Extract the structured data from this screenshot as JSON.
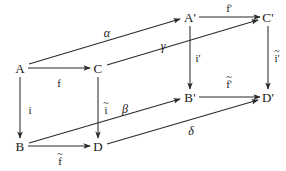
{
  "figure": {
    "kind": "commutative-cube-diagram",
    "background_color": "#ffffff",
    "stroke_color": "#2a2a2a",
    "text_color": "#181818"
  },
  "vertices": [
    {
      "id": "A",
      "label": "A",
      "x": 20,
      "y": 68
    },
    {
      "id": "C",
      "label": "C",
      "x": 98,
      "y": 68
    },
    {
      "id": "B",
      "label": "B",
      "x": 20,
      "y": 146
    },
    {
      "id": "D",
      "label": "D",
      "x": 98,
      "y": 146
    },
    {
      "id": "Ap",
      "label": "A'",
      "x": 190,
      "y": 17
    },
    {
      "id": "Cp",
      "label": "C'",
      "x": 268,
      "y": 17
    },
    {
      "id": "Bp",
      "label": "B'",
      "x": 190,
      "y": 97
    },
    {
      "id": "Dp",
      "label": "D'",
      "x": 268,
      "y": 97
    }
  ],
  "edges": [
    {
      "id": "A-to-C",
      "from": "A",
      "to": "C",
      "label": "f",
      "tilde": false,
      "greek": false,
      "label_x": 59,
      "label_y": 83
    },
    {
      "id": "A-to-B",
      "from": "A",
      "to": "B",
      "label": "i",
      "tilde": false,
      "greek": false,
      "label_x": 30,
      "label_y": 110
    },
    {
      "id": "C-to-D",
      "from": "C",
      "to": "D",
      "label": "i",
      "tilde": true,
      "greek": false,
      "label_x": 106,
      "label_y": 110
    },
    {
      "id": "B-to-D",
      "from": "B",
      "to": "D",
      "label": "f",
      "tilde": true,
      "greek": false,
      "label_x": 60,
      "label_y": 161
    },
    {
      "id": "Ap-to-Cp",
      "from": "Ap",
      "to": "Cp",
      "label": "f'",
      "tilde": false,
      "greek": false,
      "label_x": 229,
      "label_y": 8
    },
    {
      "id": "Ap-to-Bp",
      "from": "Ap",
      "to": "Bp",
      "label": "i'",
      "tilde": false,
      "greek": false,
      "label_x": 198,
      "label_y": 58
    },
    {
      "id": "Cp-to-Dp",
      "from": "Cp",
      "to": "Dp",
      "label": "i'",
      "tilde": true,
      "greek": false,
      "label_x": 277,
      "label_y": 58
    },
    {
      "id": "Bp-to-Dp",
      "from": "Bp",
      "to": "Dp",
      "label": "f'",
      "tilde": true,
      "greek": false,
      "label_x": 229,
      "label_y": 84
    },
    {
      "id": "A-to-Ap",
      "from": "A",
      "to": "Ap",
      "label": "α",
      "tilde": false,
      "greek": true,
      "label_x": 107,
      "label_y": 33
    },
    {
      "id": "C-to-Cp",
      "from": "C",
      "to": "Cp",
      "label": "γ",
      "tilde": false,
      "greek": true,
      "label_x": 163,
      "label_y": 46
    },
    {
      "id": "B-to-Bp",
      "from": "B",
      "to": "Bp",
      "label": "β",
      "tilde": false,
      "greek": true,
      "label_x": 125,
      "label_y": 109
    },
    {
      "id": "D-to-Dp",
      "from": "D",
      "to": "Dp",
      "label": "δ",
      "tilde": false,
      "greek": true,
      "label_x": 191,
      "label_y": 131
    }
  ]
}
